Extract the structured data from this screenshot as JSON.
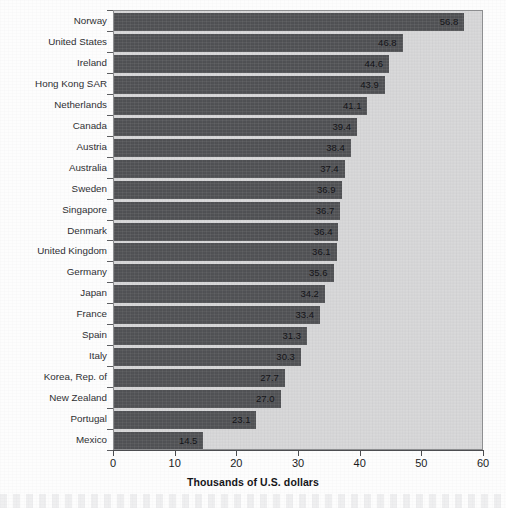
{
  "chart_data": {
    "type": "bar",
    "orientation": "horizontal",
    "title": "",
    "xlabel": "Thousands of U.S. dollars",
    "ylabel": "",
    "xlim": [
      0,
      60
    ],
    "xticks": [
      0,
      10,
      20,
      30,
      40,
      50,
      60
    ],
    "xtick_labels": [
      "0",
      "10",
      "20",
      "30",
      "40",
      "50",
      "60"
    ],
    "grid": false,
    "legend": null,
    "bar_color": "#4e4f52",
    "plot_background": "#d9d9da",
    "categories": [
      "Norway",
      "United States",
      "Ireland",
      "Hong Kong SAR",
      "Netherlands",
      "Canada",
      "Austria",
      "Australia",
      "Sweden",
      "Singapore",
      "Denmark",
      "United Kingdom",
      "Germany",
      "Japan",
      "France",
      "Spain",
      "Italy",
      "Korea, Rep. of",
      "New Zealand",
      "Portugal",
      "Mexico"
    ],
    "values": [
      56.8,
      46.8,
      44.6,
      43.9,
      41.1,
      39.4,
      38.4,
      37.4,
      36.9,
      36.7,
      36.4,
      36.1,
      35.6,
      34.2,
      33.4,
      31.3,
      30.3,
      27.7,
      27.0,
      23.1,
      14.5
    ],
    "value_labels": [
      "56.8",
      "46.8",
      "44.6",
      "43.9",
      "41.1",
      "39.4",
      "38.4",
      "37.4",
      "36.9",
      "36.7",
      "36.4",
      "36.1",
      "35.6",
      "34.2",
      "33.4",
      "31.3",
      "30.3",
      "27.7",
      "27.0",
      "23.1",
      "14.5"
    ]
  }
}
